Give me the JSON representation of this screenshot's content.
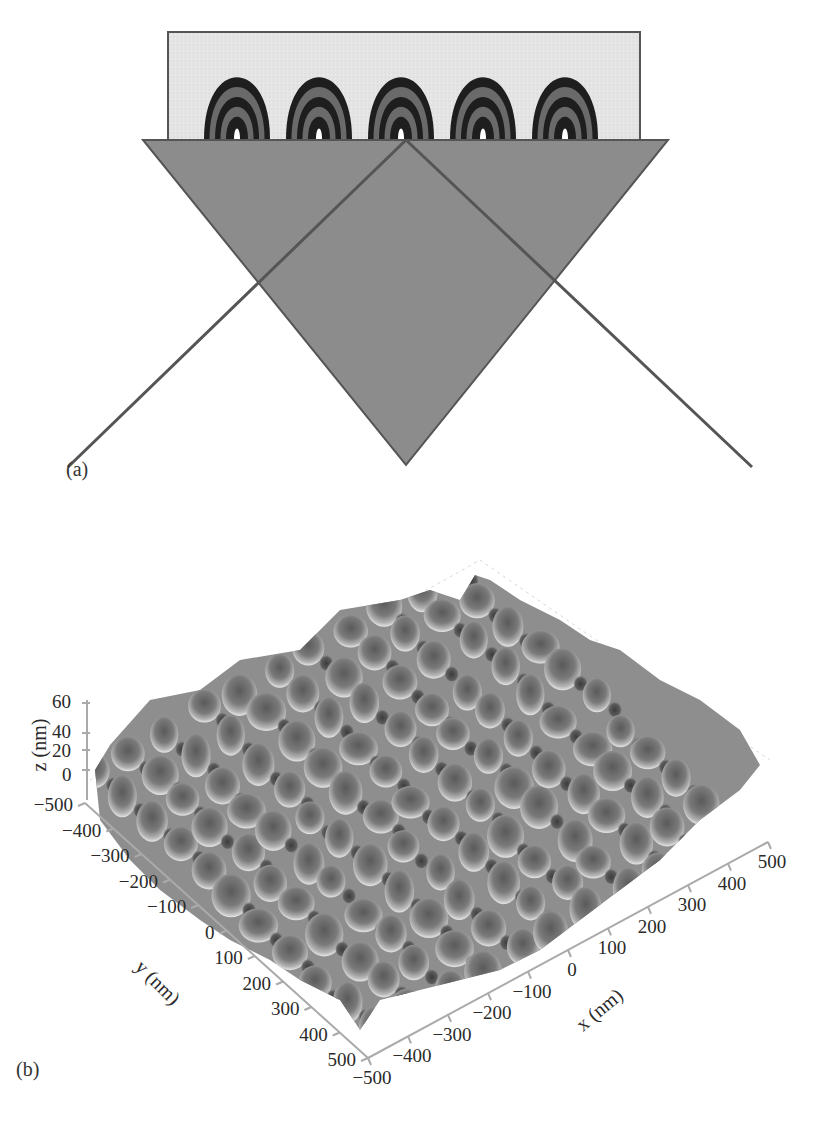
{
  "figure": {
    "panel_a": {
      "label": "(a)",
      "description": "Prism coupling geometry with periodic nanostructures on top surface",
      "substrate_color": "#e6e6e6",
      "prism_color": "#8a8a8a",
      "structure_count": 5,
      "ring_count": 5
    },
    "panel_b": {
      "label": "(b)",
      "description": "3D surface topography plot",
      "z_axis": {
        "title": "z (nm)",
        "ticks": [
          "60",
          "40",
          "20",
          "0"
        ]
      },
      "y_axis": {
        "title": "y (nm)",
        "ticks": [
          "-500",
          "-400",
          "-300",
          "-200",
          "-100",
          "0",
          "100",
          "200",
          "300",
          "400",
          "500"
        ]
      },
      "x_axis": {
        "title": "x (nm)",
        "ticks": [
          "-500",
          "-400",
          "-300",
          "-200",
          "-100",
          "0",
          "100",
          "200",
          "300",
          "400",
          "500"
        ]
      }
    }
  },
  "chart_data": {
    "type": "surface",
    "title": "",
    "xlabel": "x (nm)",
    "ylabel": "y (nm)",
    "zlabel": "z (nm)",
    "xlim": [
      -500,
      500
    ],
    "ylim": [
      -500,
      500
    ],
    "zlim": [
      0,
      60
    ],
    "x_ticks": [
      -500,
      -400,
      -300,
      -200,
      -100,
      0,
      100,
      200,
      300,
      400,
      500
    ],
    "y_ticks": [
      -500,
      -400,
      -300,
      -200,
      -100,
      0,
      100,
      200,
      300,
      400,
      500
    ],
    "z_ticks": [
      0,
      20,
      40,
      60
    ],
    "grid": true
  }
}
